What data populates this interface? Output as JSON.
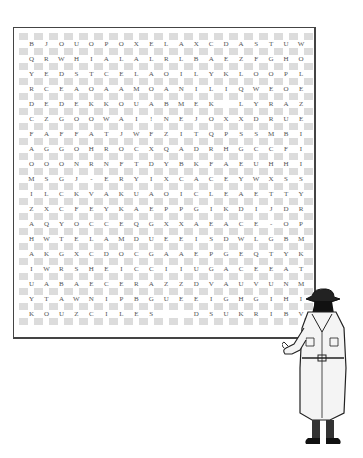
{
  "puzzle": {
    "type": "word-search",
    "rows": [
      [
        "B",
        "J",
        "O",
        "U",
        "O",
        "P",
        "O",
        "X",
        "E",
        "L",
        "A",
        "X",
        "C",
        "D",
        "A",
        "S",
        "T",
        "U",
        "W"
      ],
      [
        "Q",
        "R",
        "W",
        "H",
        "I",
        "A",
        "L",
        "A",
        "L",
        "R",
        "L",
        "B",
        "A",
        "E",
        "Z",
        "F",
        "G",
        "H",
        "O"
      ],
      [
        "Y",
        "E",
        "D",
        "S",
        "T",
        "C",
        "E",
        "L",
        "A",
        "O",
        "I",
        "L",
        "Y",
        "K",
        "L",
        "O",
        "O",
        "P",
        "L"
      ],
      [
        "R",
        "C",
        "E",
        "A",
        "O",
        "A",
        "A",
        "M",
        "O",
        "A",
        "N",
        "I",
        "L",
        "I",
        "Q",
        "W",
        "E",
        "O",
        "E"
      ],
      [
        "D",
        "E",
        "D",
        "E",
        "K",
        "K",
        "O",
        "U",
        "A",
        "B",
        "M",
        "E",
        "K",
        "",
        "L",
        "Y",
        "R",
        "A",
        "Z"
      ],
      [
        "C",
        "Z",
        "G",
        "O",
        "O",
        "W",
        "A",
        "I",
        "!",
        "N",
        "E",
        "J",
        "O",
        "X",
        "X",
        "D",
        "R",
        "U",
        "E"
      ],
      [
        "F",
        "A",
        "F",
        "F",
        "A",
        "T",
        "J",
        "W",
        "F",
        "Z",
        "I",
        "T",
        "Q",
        "P",
        "S",
        "S",
        "M",
        "B",
        "I"
      ],
      [
        "A",
        "G",
        "G",
        "O",
        "H",
        "R",
        "O",
        "C",
        "X",
        "Q",
        "A",
        "D",
        "R",
        "H",
        "G",
        "C",
        "C",
        "F",
        "I"
      ],
      [
        "O",
        "O",
        "O",
        "N",
        "R",
        "N",
        "F",
        "T",
        "D",
        "Y",
        "B",
        "K",
        "F",
        "A",
        "E",
        "U",
        "H",
        "H",
        "I"
      ],
      [
        "M",
        "S",
        "G",
        "J",
        "-",
        "E",
        "R",
        "Y",
        "I",
        "X",
        "C",
        "A",
        "C",
        "E",
        "Y",
        "W",
        "X",
        "S",
        "S"
      ],
      [
        "I",
        "L",
        "C",
        "K",
        "V",
        "A",
        "K",
        "U",
        "A",
        "O",
        "I",
        "C",
        "L",
        "E",
        "A",
        "E",
        "T",
        "T",
        "Y"
      ],
      [
        "Z",
        "X",
        "C",
        "F",
        "E",
        "Y",
        "K",
        "A",
        "E",
        "P",
        "P",
        "G",
        "I",
        "K",
        "D",
        "I",
        "J",
        "D",
        "R"
      ],
      [
        "A",
        "Q",
        "Y",
        "O",
        "C",
        "C",
        "E",
        "Q",
        "G",
        "X",
        "X",
        "A",
        "E",
        "A",
        "C",
        "E",
        "-",
        "O",
        "P"
      ],
      [
        "H",
        "W",
        "T",
        "E",
        "L",
        "A",
        "M",
        "D",
        "U",
        "E",
        "E",
        "I",
        "S",
        "D",
        "W",
        "L",
        "G",
        "B",
        "M"
      ],
      [
        "A",
        "K",
        "G",
        "X",
        "C",
        "D",
        "O",
        "C",
        "G",
        "A",
        "A",
        "E",
        "P",
        "G",
        "E",
        "Q",
        "T",
        "Y",
        "K"
      ],
      [
        "I",
        "W",
        "R",
        "S",
        "H",
        "E",
        "I",
        "C",
        "C",
        "I",
        "I",
        "U",
        "G",
        "A",
        "C",
        "E",
        "E",
        "A",
        "T"
      ],
      [
        "U",
        "A",
        "B",
        "A",
        "E",
        "C",
        "E",
        "R",
        "A",
        "Z",
        "Z",
        "D",
        "V",
        "A",
        "U",
        "V",
        "U",
        "N",
        "M"
      ],
      [
        "Y",
        "T",
        "A",
        "W",
        "N",
        "I",
        "P",
        "B",
        "G",
        "U",
        "E",
        "E",
        "I",
        "G",
        "H",
        "G",
        "I",
        "H",
        "I"
      ],
      [
        "K",
        "O",
        "U",
        "Z",
        "C",
        "I",
        "L",
        "E",
        "S",
        "",
        "",
        "D",
        "S",
        "U",
        "K",
        "R",
        "I",
        "B",
        "V"
      ]
    ]
  },
  "illustration": {
    "subject": "detective-in-trench-coat",
    "label": "detective-figure"
  },
  "colors": {
    "frame": "#444444",
    "checker": "#dcdcdc",
    "letter": "#555555",
    "background": "#ffffff"
  }
}
